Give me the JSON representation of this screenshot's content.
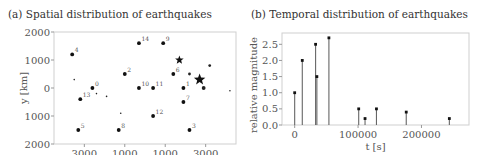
{
  "chart_data": [
    {
      "type": "scatter",
      "title": "(a) Spatial distribution of earthquakes",
      "xlabel": "x [km]",
      "ylabel": "y [km]",
      "xlim": [
        -4500,
        4500
      ],
      "ylim": [
        -2000,
        2000
      ],
      "xticks": [
        -3000,
        -1000,
        1000,
        3000
      ],
      "xtick_labels": [
        "3000",
        "1000",
        "1000",
        "3000"
      ],
      "yticks": [
        2000,
        1000,
        0,
        -1000,
        -2000
      ],
      "ytick_labels": [
        "2000",
        "1000",
        "0",
        "1000",
        "2000"
      ],
      "grid": false,
      "labeled_points": [
        {
          "label": "1",
          "x": 1900,
          "y": 0
        },
        {
          "label": "2",
          "x": -1000,
          "y": 500
        },
        {
          "label": "3",
          "x": 2200,
          "y": -1500
        },
        {
          "label": "4",
          "x": -3600,
          "y": 1200
        },
        {
          "label": "5",
          "x": -3300,
          "y": -1500
        },
        {
          "label": "6",
          "x": 1400,
          "y": 500
        },
        {
          "label": "7",
          "x": 1900,
          "y": -500
        },
        {
          "label": "8",
          "x": -1300,
          "y": -1500
        },
        {
          "label": "9",
          "x": 900,
          "y": 1600
        },
        {
          "label": "10",
          "x": -300,
          "y": 0
        },
        {
          "label": "11",
          "x": 400,
          "y": 0
        },
        {
          "label": "12",
          "x": 400,
          "y": -1000
        },
        {
          "label": "13",
          "x": -3200,
          "y": -400
        },
        {
          "label": "14",
          "x": -300,
          "y": 1600
        },
        {
          "label": "0",
          "x": -2600,
          "y": 0
        }
      ],
      "extra_points": [
        {
          "x": 2900,
          "y": 0,
          "size": "medium"
        },
        {
          "x": 2200,
          "y": 500,
          "size": "small"
        },
        {
          "x": 3200,
          "y": 800,
          "size": "small"
        },
        {
          "x": 4200,
          "y": -100,
          "size": "tiny"
        },
        {
          "x": -3500,
          "y": 300,
          "size": "tiny"
        },
        {
          "x": -2400,
          "y": -200,
          "size": "tiny"
        },
        {
          "x": -1900,
          "y": -300,
          "size": "tiny"
        },
        {
          "x": -1200,
          "y": -900,
          "size": "tiny"
        }
      ],
      "stars": [
        {
          "x": 1700,
          "y": 1000,
          "size": "medium"
        },
        {
          "x": 2700,
          "y": 300,
          "size": "large"
        }
      ]
    },
    {
      "type": "bar",
      "subtype": "stem",
      "title": "(b) Temporal distribution of earthquakes",
      "xlabel": "t [s]",
      "ylabel": "relative magnitude",
      "xlim": [
        -20000,
        275000
      ],
      "ylim": [
        0,
        2.85
      ],
      "xticks": [
        0,
        100000,
        200000
      ],
      "xtick_labels": [
        "0",
        "100000",
        "200000"
      ],
      "yticks": [
        0.0,
        0.5,
        1.0,
        1.5,
        2.0,
        2.5
      ],
      "ytick_labels": [
        "0.0",
        "0.5",
        "1.0",
        "1.5",
        "2.0",
        "2.5"
      ],
      "grid": false,
      "x": [
        0,
        12000,
        33000,
        35000,
        54000,
        101000,
        111000,
        129000,
        176000,
        244000
      ],
      "values": [
        1.0,
        2.0,
        2.5,
        1.5,
        2.7,
        0.5,
        0.2,
        0.5,
        0.4,
        0.2
      ]
    }
  ]
}
